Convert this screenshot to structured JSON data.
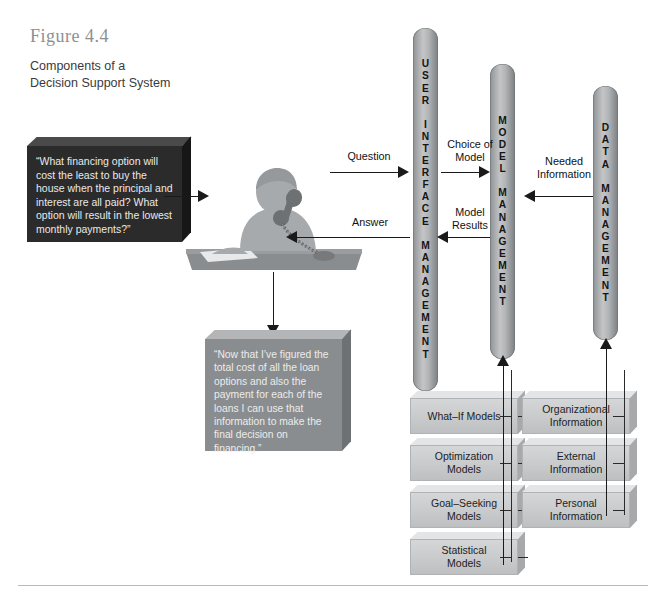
{
  "figure": {
    "number": "Figure 4.4",
    "title": "Components of a\nDecision Support System"
  },
  "colors": {
    "pillar_grey": "#b2b5b7",
    "box_grey": "#c8cacc",
    "dark_box": "#2b2b2b",
    "thought_box": "#8a8d8f",
    "arrow_black": "#1a1a1a",
    "caption_grey": "#8d8f92"
  },
  "question_box": {
    "text": "“What financing option will cost the least to buy the house when the principal and interest are all paid? What option will result in the lowest monthly payments?”"
  },
  "answer_box": {
    "text": "“Now that I’ve figured the total cost of all the loan options and also the payment for each of the loans I can use that information to make the final decision on financing.”"
  },
  "person": {
    "alt": "person-at-desk-on-telephone"
  },
  "pillars": [
    {
      "id": "user-interface-management",
      "label": "USER\nINTERFACE\nMANAGEMENT",
      "letters": "U\nS\nE\nR\n\nI\nN\nT\nE\nR\nF\nA\nC\nE\n\nM\nA\nN\nA\nG\nE\nM\nE\nN\nT"
    },
    {
      "id": "model-management",
      "label": "MODEL\nMANAGEMENT",
      "letters": "M\nO\nD\nE\nL\n\nM\nA\nN\nA\nG\nE\nM\nE\nN\nT"
    },
    {
      "id": "data-management",
      "label": "DATA\nMANAGEMENT",
      "letters": "D\nA\nT\nA\n\nM\nA\nN\nA\nG\nE\nM\nE\nN\nT"
    }
  ],
  "flows": [
    {
      "id": "question",
      "label": "Question",
      "direction": "right"
    },
    {
      "id": "answer",
      "label": "Answer",
      "direction": "left"
    },
    {
      "id": "choice-of-model",
      "label": "Choice of\nModel",
      "direction": "right"
    },
    {
      "id": "model-results",
      "label": "Model\nResults",
      "direction": "left"
    },
    {
      "id": "needed-information",
      "label": "Needed\nInformation",
      "direction": "left"
    }
  ],
  "model_boxes": [
    {
      "id": "what-if-models",
      "label": "What–If Models"
    },
    {
      "id": "optimization-models",
      "label": "Optimization\nModels"
    },
    {
      "id": "goal-seeking-models",
      "label": "Goal–Seeking\nModels"
    },
    {
      "id": "statistical-models",
      "label": "Statistical\nModels"
    }
  ],
  "data_boxes": [
    {
      "id": "organizational-information",
      "label": "Organizational\nInformation"
    },
    {
      "id": "external-information",
      "label": "External\nInformation"
    },
    {
      "id": "personal-information",
      "label": "Personal\nInformation"
    }
  ]
}
